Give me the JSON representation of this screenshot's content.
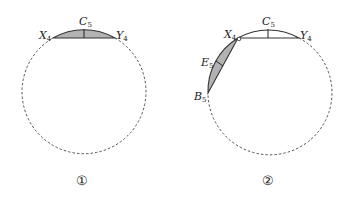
{
  "figures": [
    {
      "id": "1",
      "caption": "①",
      "labels": {
        "X": {
          "base": "X",
          "sub": "4"
        },
        "Y": {
          "base": "Y",
          "sub": "4"
        },
        "C": {
          "base": "C",
          "sub": "5"
        }
      }
    },
    {
      "id": "2",
      "caption": "②",
      "labels": {
        "X": {
          "base": "X",
          "sub": "4"
        },
        "Y": {
          "base": "Y",
          "sub": "4"
        },
        "C": {
          "base": "C",
          "sub": "5"
        },
        "E": {
          "base": "E",
          "sub": "5"
        },
        "B": {
          "base": "B",
          "sub": "5"
        }
      }
    }
  ],
  "colors": {
    "shade": "#b3b3b3",
    "stroke": "#333333",
    "dash": "#555555"
  }
}
